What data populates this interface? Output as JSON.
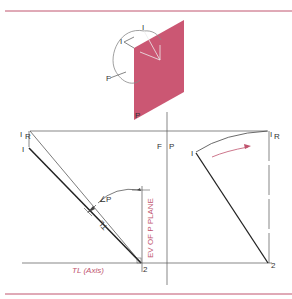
{
  "figure": {
    "colors": {
      "rule": "#c0546e",
      "plane": "#c23a5a",
      "line": "#333333",
      "accent": "#c0546e"
    },
    "pictorial": {
      "labels": {
        "point1": "I",
        "point1_rotated": "I",
        "front": "F",
        "edge": "P"
      }
    },
    "left_view": {
      "point_1": "I",
      "point_1R": "I",
      "point_1R_sub": "R",
      "point_2": "2",
      "angle_label": "∠P",
      "true_length_label": "TL",
      "edge_view_label": "EV OF P PLANE",
      "axis_label": "TL (Axis)"
    },
    "fold_line": {
      "label_left": "F",
      "label_right": "P"
    },
    "right_view": {
      "point_1": "I",
      "point_1R": "I",
      "point_1R_sub": "R",
      "point_2": "2"
    }
  }
}
